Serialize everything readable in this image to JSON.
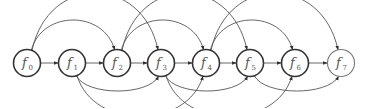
{
  "diagram": {
    "type": "directed-graph",
    "colors": {
      "edge": "#555555",
      "node_stroke": "#333333",
      "label": "#555555",
      "background": "#ffffff"
    },
    "nodes": [
      {
        "id": "f0",
        "base": "f",
        "sub": "0",
        "x": 27,
        "y": 63
      },
      {
        "id": "f1",
        "base": "f",
        "sub": "1",
        "x": 72,
        "y": 63
      },
      {
        "id": "f2",
        "base": "f",
        "sub": "2",
        "x": 117,
        "y": 63
      },
      {
        "id": "f3",
        "base": "f",
        "sub": "3",
        "x": 161,
        "y": 63
      },
      {
        "id": "f4",
        "base": "f",
        "sub": "4",
        "x": 206,
        "y": 63
      },
      {
        "id": "f5",
        "base": "f",
        "sub": "5",
        "x": 250,
        "y": 63
      },
      {
        "id": "f6",
        "base": "f",
        "sub": "6",
        "x": 295,
        "y": 63
      },
      {
        "id": "f7",
        "base": "f",
        "sub": "7",
        "x": 341,
        "y": 63
      }
    ],
    "edges": [
      {
        "from": "f0",
        "to": "f1",
        "kind": "straight"
      },
      {
        "from": "f1",
        "to": "f2",
        "kind": "straight"
      },
      {
        "from": "f2",
        "to": "f3",
        "kind": "straight"
      },
      {
        "from": "f3",
        "to": "f4",
        "kind": "straight"
      },
      {
        "from": "f4",
        "to": "f5",
        "kind": "straight"
      },
      {
        "from": "f5",
        "to": "f6",
        "kind": "straight"
      },
      {
        "from": "f6",
        "to": "f7",
        "kind": "straight"
      },
      {
        "from": "f0",
        "to": "f2",
        "kind": "arc-top-low"
      },
      {
        "from": "f0",
        "to": "f3",
        "kind": "arc-top-high"
      },
      {
        "from": "f2",
        "to": "f4",
        "kind": "arc-top-low"
      },
      {
        "from": "f2",
        "to": "f5",
        "kind": "arc-top-high"
      },
      {
        "from": "f4",
        "to": "f6",
        "kind": "arc-top-low"
      },
      {
        "from": "f4",
        "to": "f7",
        "kind": "arc-top-high"
      },
      {
        "from": "f1",
        "to": "f3",
        "kind": "arc-bottom-low"
      },
      {
        "from": "f1",
        "to": "f4",
        "kind": "arc-bottom-deep"
      },
      {
        "from": "f3",
        "to": "f5",
        "kind": "arc-bottom-low"
      },
      {
        "from": "f3",
        "to": "f6",
        "kind": "arc-bottom-deep"
      },
      {
        "from": "f5",
        "to": "f7",
        "kind": "arc-bottom-low"
      }
    ]
  }
}
